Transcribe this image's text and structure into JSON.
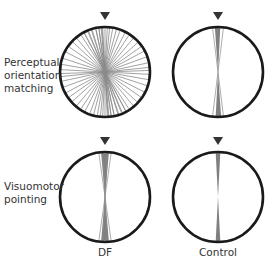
{
  "rows": [
    {
      "label_lines": [
        "Perceptual",
        "orientation",
        "matching"
      ]
    },
    {
      "label_lines": [
        "Visuomotor",
        "pointing"
      ]
    }
  ],
  "columns": [
    {
      "label": "DF"
    },
    {
      "label": "Control"
    }
  ],
  "colors": {
    "circle_stroke": "#1a1a1a",
    "marker": "#333333",
    "line": "#8a8a8a",
    "fan_fill": "#808080",
    "text": "#333333"
  },
  "panels": [
    {
      "row": 0,
      "col": 0,
      "cx": 105,
      "cy": 72,
      "r": 45,
      "style": "lines",
      "angles_deg": [
        -28,
        -22,
        -17,
        -12,
        -8,
        -5,
        -3,
        0,
        3,
        6,
        10,
        15,
        20,
        27,
        33,
        40,
        48,
        55,
        62,
        70,
        78,
        84,
        88,
        93,
        100,
        108,
        117,
        125,
        133,
        140,
        147,
        152,
        157,
        162,
        168,
        172,
        176
      ]
    },
    {
      "row": 0,
      "col": 1,
      "cx": 218,
      "cy": 72,
      "r": 45,
      "style": "fan",
      "fan_deg": [
        -4,
        3
      ],
      "extra_lines_deg": [
        7,
        -7
      ]
    },
    {
      "row": 1,
      "col": 0,
      "cx": 105,
      "cy": 197,
      "r": 45,
      "style": "fan",
      "fan_deg": [
        -5,
        5
      ],
      "extra_lines_deg": [
        -8,
        8,
        -3,
        3
      ]
    },
    {
      "row": 1,
      "col": 1,
      "cx": 218,
      "cy": 197,
      "r": 45,
      "style": "fan",
      "fan_deg": [
        -3,
        3
      ],
      "extra_lines_deg": []
    }
  ]
}
